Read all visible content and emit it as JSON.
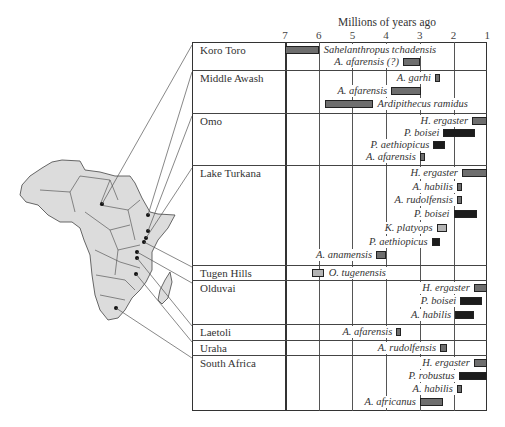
{
  "chart_data": {
    "type": "bar",
    "subtype": "horizontal range (timeline)",
    "title": "",
    "xlabel": "Millions of years ago",
    "x_ticks": [
      7,
      6,
      5,
      4,
      3,
      2,
      1
    ],
    "xlim": [
      7,
      1
    ],
    "x_reversed": true,
    "grid": true,
    "legend": "none",
    "color_key": {
      "gray": "#6e6e6e",
      "dark": "#1c1c1c",
      "light": "#b0b0b0"
    },
    "sites": [
      {
        "name": "Koro Toro",
        "taxa": [
          {
            "label": "Sahelanthropus tchadensis",
            "start": 7.0,
            "end": 6.0,
            "color": "gray"
          },
          {
            "label": "A. afarensis (?)",
            "start": 3.5,
            "end": 3.0,
            "color": "gray"
          }
        ]
      },
      {
        "name": "Middle Awash",
        "taxa": [
          {
            "label": "A. garhi",
            "start": 2.55,
            "end": 2.4,
            "color": "gray"
          },
          {
            "label": "A. afarensis",
            "start": 3.85,
            "end": 2.95,
            "color": "gray"
          },
          {
            "label": "Ardipithecus ramidus",
            "start": 5.8,
            "end": 4.4,
            "color": "gray"
          }
        ]
      },
      {
        "name": "Omo",
        "taxa": [
          {
            "label": "H. ergaster",
            "start": 1.45,
            "end": 1.0,
            "color": "gray"
          },
          {
            "label": "P. boisei",
            "start": 2.3,
            "end": 1.35,
            "color": "dark"
          },
          {
            "label": "P. aethiopicus",
            "start": 2.6,
            "end": 2.25,
            "color": "dark"
          },
          {
            "label": "A. afarensis",
            "start": 3.0,
            "end": 2.85,
            "color": "gray"
          }
        ]
      },
      {
        "name": "Lake Turkana",
        "taxa": [
          {
            "label": "H. ergaster",
            "start": 1.75,
            "end": 1.0,
            "color": "gray"
          },
          {
            "label": "A. habilis",
            "start": 1.9,
            "end": 1.75,
            "color": "gray"
          },
          {
            "label": "A. rudolfensis",
            "start": 1.9,
            "end": 1.75,
            "color": "gray"
          },
          {
            "label": "P. boisei",
            "start": 2.0,
            "end": 1.3,
            "color": "dark"
          },
          {
            "label": "K. platyops",
            "start": 2.5,
            "end": 2.2,
            "color": "light"
          },
          {
            "label": "P. aethiopicus",
            "start": 2.65,
            "end": 2.4,
            "color": "dark"
          },
          {
            "label": "A. anamensis",
            "start": 4.3,
            "end": 4.0,
            "color": "gray"
          }
        ]
      },
      {
        "name": "Tugen Hills",
        "taxa": [
          {
            "label": "O. tugenensis",
            "start": 6.2,
            "end": 5.85,
            "color": "light"
          }
        ]
      },
      {
        "name": "Olduvai",
        "taxa": [
          {
            "label": "H. ergaster",
            "start": 1.4,
            "end": 1.0,
            "color": "gray"
          },
          {
            "label": "P. boisei",
            "start": 1.8,
            "end": 1.15,
            "color": "dark"
          },
          {
            "label": "A. habilis",
            "start": 1.95,
            "end": 1.4,
            "color": "dark"
          }
        ]
      },
      {
        "name": "Laetoli",
        "taxa": [
          {
            "label": "A. afarensis",
            "start": 3.7,
            "end": 3.55,
            "color": "gray"
          }
        ]
      },
      {
        "name": "Uraha",
        "taxa": [
          {
            "label": "A. rudolfensis",
            "start": 2.4,
            "end": 2.2,
            "color": "gray"
          }
        ]
      },
      {
        "name": "South Africa",
        "taxa": [
          {
            "label": "H. ergaster",
            "start": 1.4,
            "end": 1.0,
            "color": "gray"
          },
          {
            "label": "P. robustus",
            "start": 1.85,
            "end": 1.0,
            "color": "dark"
          },
          {
            "label": "A. habilis",
            "start": 1.9,
            "end": 1.75,
            "color": "gray"
          },
          {
            "label": "A. africanus",
            "start": 3.0,
            "end": 2.3,
            "color": "gray"
          }
        ]
      }
    ]
  },
  "map": {
    "name": "Africa",
    "fill": "#dcdcdc",
    "stroke": "#444444"
  }
}
